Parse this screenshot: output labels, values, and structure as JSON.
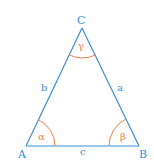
{
  "diagram": {
    "type": "triangle",
    "colors": {
      "edge": "#3a8fd0",
      "angle_arc": "#e8804a",
      "label_vertex": "#3a8fd0",
      "label_angle": "#e8804a"
    },
    "vertices": [
      {
        "id": "A",
        "label": "A",
        "x": 26,
        "y": 146
      },
      {
        "id": "B",
        "label": "B",
        "x": 139,
        "y": 146
      },
      {
        "id": "C",
        "label": "C",
        "x": 82,
        "y": 28
      }
    ],
    "sides": [
      {
        "id": "a",
        "label": "a",
        "between": [
          "B",
          "C"
        ]
      },
      {
        "id": "b",
        "label": "b",
        "between": [
          "A",
          "C"
        ]
      },
      {
        "id": "c",
        "label": "c",
        "between": [
          "A",
          "B"
        ]
      }
    ],
    "angles": [
      {
        "id": "alpha",
        "label": "α",
        "at": "A"
      },
      {
        "id": "beta",
        "label": "β",
        "at": "B"
      },
      {
        "id": "gamma",
        "label": "γ",
        "at": "C"
      }
    ]
  }
}
